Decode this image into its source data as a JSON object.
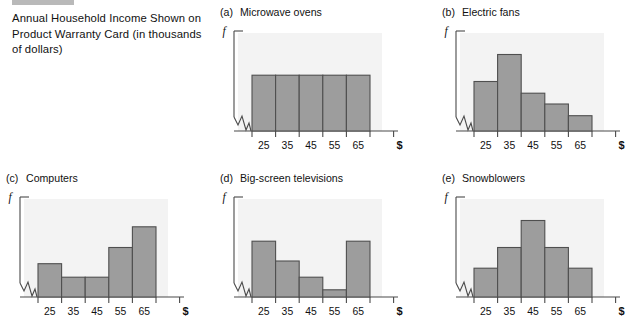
{
  "caption": {
    "text": "Annual Household Income Shown on Product Warranty Card (in thousands of dollars)"
  },
  "axis": {
    "y_label": "f",
    "x_unit_label": "$",
    "tick_labels": [
      "25",
      "35",
      "45",
      "55",
      "65"
    ]
  },
  "panels": [
    {
      "letter": "(a)",
      "title": "Microwave ovens"
    },
    {
      "letter": "(b)",
      "title": "Electric fans"
    },
    {
      "letter": "(c)",
      "title": "Computers"
    },
    {
      "letter": "(d)",
      "title": "Big-screen televisions"
    },
    {
      "letter": "(e)",
      "title": "Snowblowers"
    }
  ],
  "colors": {
    "bar_fill": "#9d9d9d",
    "bar_stroke": "#4f4f4f",
    "axis": "#4a4a4a",
    "plot_background": "#f3f3f3",
    "top_rule": "#b9b9b9"
  },
  "chart_data": [
    {
      "type": "bar",
      "title": "Microwave ovens",
      "panel": "(a)",
      "xlabel": "$",
      "ylabel": "f",
      "categories": [
        "25",
        "35",
        "45",
        "55",
        "65"
      ],
      "values": [
        62,
        62,
        62,
        62,
        62
      ],
      "ylim": [
        0,
        100
      ],
      "grid": false,
      "legend": "none",
      "shape": "uniform"
    },
    {
      "type": "bar",
      "title": "Electric fans",
      "panel": "(b)",
      "xlabel": "$",
      "ylabel": "f",
      "categories": [
        "25",
        "35",
        "45",
        "55",
        "65"
      ],
      "values": [
        55,
        85,
        42,
        30,
        17
      ],
      "ylim": [
        0,
        100
      ],
      "grid": false,
      "legend": "none",
      "shape": "skewed-right"
    },
    {
      "type": "bar",
      "title": "Computers",
      "panel": "(c)",
      "xlabel": "$",
      "ylabel": "f",
      "categories": [
        "25",
        "35",
        "45",
        "55",
        "65"
      ],
      "values": [
        37,
        22,
        22,
        55,
        78
      ],
      "ylim": [
        0,
        100
      ],
      "grid": false,
      "legend": "none",
      "shape": "skewed-left"
    },
    {
      "type": "bar",
      "title": "Big-screen televisions",
      "panel": "(d)",
      "xlabel": "$",
      "ylabel": "f",
      "categories": [
        "25",
        "35",
        "45",
        "55",
        "65"
      ],
      "values": [
        62,
        40,
        22,
        8,
        62
      ],
      "ylim": [
        0,
        100
      ],
      "grid": false,
      "legend": "none",
      "shape": "bimodal-u"
    },
    {
      "type": "bar",
      "title": "Snowblowers",
      "panel": "(e)",
      "xlabel": "$",
      "ylabel": "f",
      "categories": [
        "25",
        "35",
        "45",
        "55",
        "65"
      ],
      "values": [
        32,
        55,
        85,
        55,
        32
      ],
      "ylim": [
        0,
        100
      ],
      "grid": false,
      "legend": "none",
      "shape": "symmetric-bell"
    }
  ]
}
